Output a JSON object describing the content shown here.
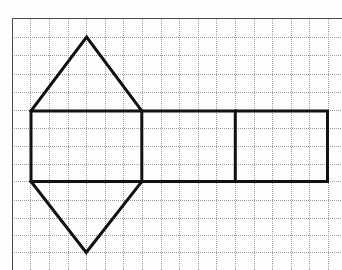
{
  "figure": {
    "size": {
      "width": 342,
      "height": 270
    },
    "colors": {
      "background": "#fdfdfd",
      "grid": "#9a9a9a",
      "grid_border": "#4a4a4a",
      "net": "#111111"
    },
    "grid": {
      "border_left_x": 12.2,
      "border_top_y": 18.7,
      "vertical_lines_x": [
        30.8,
        49.4,
        68,
        86.6,
        105.2,
        123.8,
        142.4,
        161,
        179.6,
        198.2,
        216.8,
        235.4,
        254,
        272.6,
        291.2,
        309.8,
        328.4
      ],
      "horizontal_lines_y": [
        37,
        55.5,
        74,
        92.3,
        110.7,
        128.5,
        146.2,
        164,
        181.5,
        200,
        218,
        235.5,
        252.5
      ]
    },
    "net": {
      "rectangle": {
        "x1": 31,
        "y1": 111,
        "x2": 327.5,
        "y2": 181.5
      },
      "dividers_x": [
        141.8,
        235.3
      ],
      "top_triangle": [
        [
          31,
          111
        ],
        [
          86.6,
          37
        ],
        [
          141.8,
          111
        ]
      ],
      "bottom_triangle": [
        [
          31,
          181.5
        ],
        [
          86.2,
          252.5
        ],
        [
          141.8,
          181.5
        ]
      ]
    }
  }
}
